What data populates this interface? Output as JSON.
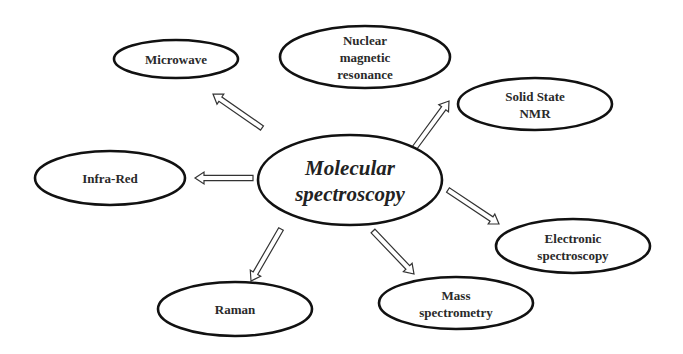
{
  "diagram": {
    "center": {
      "label_lines": [
        "Molecular",
        "spectroscopy"
      ],
      "cx": 350,
      "cy": 180,
      "rx": 92,
      "ry": 45
    },
    "nodes": [
      {
        "id": "microwave",
        "label_lines": [
          "Microwave"
        ],
        "cx": 176,
        "cy": 59,
        "rx": 62,
        "ry": 19,
        "arrow": {
          "x1": 262,
          "y1": 128,
          "x2": 213,
          "y2": 94
        }
      },
      {
        "id": "nmr",
        "label_lines": [
          "Nuclear",
          "magnetic",
          "resonance"
        ],
        "cx": 365,
        "cy": 57,
        "rx": 85,
        "ry": 31,
        "arrow": null
      },
      {
        "id": "solid-state-nmr",
        "label_lines": [
          "Solid State",
          "NMR"
        ],
        "cx": 535,
        "cy": 104,
        "rx": 77,
        "ry": 26,
        "arrow": {
          "x1": 413,
          "y1": 150,
          "x2": 449,
          "y2": 101
        }
      },
      {
        "id": "infra-red",
        "label_lines": [
          "Infra-Red"
        ],
        "cx": 110,
        "cy": 178,
        "rx": 75,
        "ry": 27,
        "arrow": {
          "x1": 253,
          "y1": 178,
          "x2": 195,
          "y2": 178
        }
      },
      {
        "id": "electronic-spectroscopy",
        "label_lines": [
          "Electronic",
          "spectroscopy"
        ],
        "cx": 573,
        "cy": 246,
        "rx": 77,
        "ry": 27,
        "arrow": {
          "x1": 448,
          "y1": 190,
          "x2": 499,
          "y2": 224
        }
      },
      {
        "id": "mass-spectrometry",
        "label_lines": [
          "Mass",
          "spectrometry"
        ],
        "cx": 456,
        "cy": 303,
        "rx": 77,
        "ry": 26,
        "arrow": {
          "x1": 373,
          "y1": 231,
          "x2": 414,
          "y2": 274
        }
      },
      {
        "id": "raman",
        "label_lines": [
          "Raman"
        ],
        "cx": 235,
        "cy": 309,
        "rx": 77,
        "ry": 27,
        "arrow": {
          "x1": 281,
          "y1": 229,
          "x2": 251,
          "y2": 281
        }
      }
    ]
  }
}
